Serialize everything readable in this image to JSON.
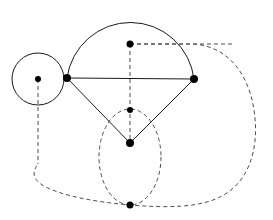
{
  "figure": {
    "kind": "geometry-construction-diagram",
    "width": 273,
    "height": 220,
    "background_color": "#ffffff",
    "solid_stroke_color": "#1a1a1a",
    "dashed_stroke_color": "#4d4d4d",
    "vertex_color": "#000000",
    "stroke_width": 1,
    "dash_pattern": "4 3",
    "caption": "",
    "title": ""
  },
  "vertices": [
    {
      "id": "small-circle-center",
      "name": "small-circle-center-vertex",
      "x": 38,
      "y": 79,
      "radius": 3,
      "label": ""
    },
    {
      "id": "left-junction",
      "name": "left-junction-vertex",
      "x": 67,
      "y": 78,
      "radius": 4,
      "label": ""
    },
    {
      "id": "right-junction",
      "name": "right-junction-vertex",
      "x": 194,
      "y": 79,
      "radius": 4,
      "label": ""
    },
    {
      "id": "upper-center",
      "name": "upper-center-vertex",
      "x": 130,
      "y": 44,
      "radius": 3.5,
      "label": ""
    },
    {
      "id": "mid-center",
      "name": "mid-center-vertex",
      "x": 130,
      "y": 110,
      "radius": 3,
      "label": ""
    },
    {
      "id": "triangle-apex",
      "name": "triangle-lower-apex-vertex",
      "x": 130,
      "y": 143,
      "radius": 4,
      "label": ""
    },
    {
      "id": "bottom-center",
      "name": "bottom-center-vertex",
      "x": 130,
      "y": 205,
      "radius": 3.5,
      "label": ""
    }
  ],
  "solid_shapes": {
    "small_circle": {
      "name": "small-circle",
      "cx": 38,
      "cy": 79,
      "r": 26
    },
    "major_arc": {
      "name": "major-arc-semicircle",
      "path": "M 67 78 A 64 64 0 0 1 194 79",
      "from": "left-junction",
      "to": "right-junction",
      "apex_y": 15
    },
    "chord": {
      "name": "horizontal-chord-segment",
      "x1": 67,
      "y1": 78,
      "x2": 194,
      "y2": 79
    },
    "left_leg": {
      "name": "triangle-left-leg-segment",
      "x1": 67,
      "y1": 78,
      "x2": 130,
      "y2": 143
    },
    "right_leg": {
      "name": "triangle-right-leg-segment",
      "x1": 194,
      "y1": 79,
      "x2": 130,
      "y2": 143
    }
  },
  "dashed_shapes": {
    "vertical_axis": {
      "name": "vertical-dashed-axis-segment",
      "x1": 130,
      "y1": 44,
      "x2": 130,
      "y2": 143
    },
    "horizontal_ray": {
      "name": "horizontal-dashed-ray-segment",
      "x1": 130,
      "y1": 44,
      "x2": 232,
      "y2": 44
    },
    "circle_center_drop": {
      "name": "circle-center-vertical-dashed-segment",
      "x1": 38,
      "y1": 79,
      "x2": 38,
      "y2": 164
    },
    "inner_ellipse": {
      "name": "inner-dashed-ellipse",
      "cx": 130,
      "cy": 157,
      "rx": 31,
      "ry": 48
    },
    "outer_contour": {
      "name": "outer-dashed-contour",
      "path": "M 130 44 L 190 44 C 224 44 248 70 254 110 C 260 150 248 182 222 196 C 200 208 166 208 130 205 C 96 202 62 196 44 186 C 32 179 32 172 38 164"
    }
  }
}
